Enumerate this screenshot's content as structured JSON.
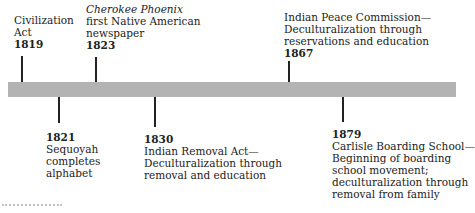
{
  "timeline": {
    "bar_color": "#b3b3b3",
    "events": [
      {
        "year": "1819",
        "lines": [
          "Civilization",
          "Act"
        ],
        "position": "above"
      },
      {
        "year": "1823",
        "lines_italic": [
          "Cherokee Phoenix"
        ],
        "lines": [
          "first Native American",
          "newspaper"
        ],
        "position": "above"
      },
      {
        "year": "1821",
        "lines": [
          "Sequoyah",
          "completes",
          "alphabet"
        ],
        "position": "below"
      },
      {
        "year": "1830",
        "lines": [
          "Indian Removal Act—",
          "Deculturalization through",
          "removal and education"
        ],
        "position": "below"
      },
      {
        "year": "1867",
        "lines": [
          "Indian Peace Commission—",
          "Deculturalization through",
          "reservations and education"
        ],
        "position": "above"
      },
      {
        "year": "1879",
        "lines": [
          "Carlisle Boarding School—",
          "Beginning of boarding",
          "school movement;",
          "deculturalization through",
          "removal from family"
        ],
        "position": "below"
      }
    ]
  }
}
